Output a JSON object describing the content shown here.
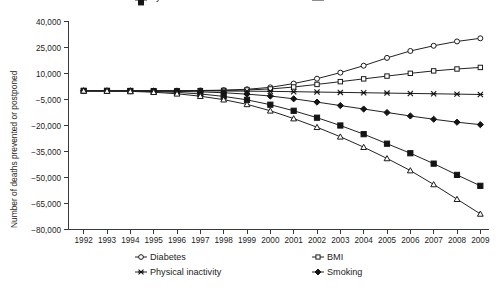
{
  "chart_data": {
    "type": "line",
    "title": "",
    "xlabel": "",
    "ylabel": "Number of deaths prevented or postponed",
    "x": [
      1992,
      1993,
      1994,
      1995,
      1996,
      1997,
      1998,
      1999,
      2000,
      2001,
      2002,
      2003,
      2004,
      2005,
      2006,
      2007,
      2008,
      2009
    ],
    "x_tick_labels": [
      "1992",
      "1993",
      "1994",
      "1995",
      "1996",
      "1997",
      "1998",
      "1999",
      "2000",
      "2001",
      "2002",
      "2003",
      "2004",
      "2005",
      "2006",
      "2007",
      "2008",
      "2009"
    ],
    "y_tick_labels": [
      "40,000",
      "25,000",
      "10,000",
      "−5,000",
      "−20,000",
      "−35,000",
      "−50,000",
      "−65,000",
      "−80,000"
    ],
    "y_ticks": [
      40000,
      25000,
      10000,
      -5000,
      -20000,
      -35000,
      -50000,
      -65000,
      -80000
    ],
    "ylim": [
      -80000,
      40000
    ],
    "grid": false,
    "legend_position": "bottom",
    "series": [
      {
        "name": "Diabetes",
        "marker": "open-circle",
        "values": [
          0,
          0,
          0,
          0,
          100,
          200,
          400,
          900,
          2000,
          4200,
          7000,
          10500,
          14500,
          19000,
          23000,
          26000,
          28500,
          30300
        ]
      },
      {
        "name": "BMI",
        "marker": "open-square",
        "values": [
          0,
          0,
          0,
          0,
          0,
          100,
          200,
          500,
          1100,
          2200,
          3700,
          5300,
          6900,
          8500,
          10100,
          11500,
          12600,
          13500
        ]
      },
      {
        "name": "Physical inactivity",
        "marker": "cross",
        "values": [
          0,
          0,
          0,
          0,
          0,
          0,
          -100,
          -200,
          -300,
          -500,
          -700,
          -900,
          -1100,
          -1300,
          -1500,
          -1700,
          -1900,
          -2100
        ]
      },
      {
        "name": "Smoking",
        "marker": "filled-diamond",
        "values": [
          0,
          0,
          0,
          -100,
          -300,
          -600,
          -1100,
          -1900,
          -3000,
          -4600,
          -6500,
          -8500,
          -10500,
          -12500,
          -14500,
          -16400,
          -18100,
          -19500
        ]
      },
      {
        "name": "Systolic Blood Pressure",
        "marker": "filled-square",
        "values": [
          0,
          0,
          -100,
          -400,
          -900,
          -1800,
          -3200,
          -5200,
          -8000,
          -11500,
          -15500,
          -20000,
          -25000,
          -30500,
          -36000,
          -42000,
          -48500,
          -54800
        ]
      },
      {
        "name": "Total Cholesterol",
        "marker": "open-triangle",
        "values": [
          0,
          -100,
          -300,
          -800,
          -1700,
          -3100,
          -5100,
          -7800,
          -11500,
          -16000,
          -21000,
          -26500,
          -32500,
          -39000,
          -46000,
          -54000,
          -62500,
          -71000
        ]
      }
    ]
  },
  "legend": {
    "entries": [
      {
        "label": "Diabetes",
        "marker": "open-circle"
      },
      {
        "label": "BMI",
        "marker": "open-square"
      },
      {
        "label": "Physical inactivity",
        "marker": "cross"
      },
      {
        "label": "Smoking",
        "marker": "filled-diamond"
      },
      {
        "label": "Systolic Blood Pressure",
        "marker": "filled-square"
      },
      {
        "label": "Total Cholesterol",
        "marker": "open-triangle"
      }
    ]
  },
  "colors": {
    "line": "#222222",
    "axis": "#3a3a3a",
    "text": "#1c1c1c",
    "background": "#ffffff"
  }
}
